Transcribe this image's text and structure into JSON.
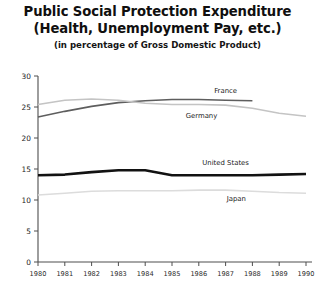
{
  "header": {
    "title_line_1": "Public Social Protection Expenditure",
    "title_line_2": "(Health, Unemployment Pay, etc.)",
    "subtitle": "(in percentage of Gross Domestic Product)"
  },
  "chart_data": {
    "type": "line",
    "title": "Public Social Protection Expenditure (Health, Unemployment Pay, etc.)",
    "subtitle": "(in percentage of Gross Domestic Product)",
    "xlabel": "",
    "ylabel": "",
    "grid": false,
    "legend_position": "inline-labels",
    "xlim": [
      1980,
      1990
    ],
    "ylim": [
      0,
      30
    ],
    "ytick_labels": [
      "0",
      "5",
      "10",
      "15",
      "20",
      "25",
      "30"
    ],
    "yticks": [
      0,
      5,
      10,
      15,
      20,
      25,
      30
    ],
    "x": [
      1980,
      1981,
      1982,
      1983,
      1984,
      1985,
      1986,
      1987,
      1988,
      1989,
      1990
    ],
    "xtick_labels": [
      "1980",
      "1981",
      "1982",
      "1983",
      "1984",
      "1985",
      "1986",
      "1987",
      "1988",
      "1989",
      "1990"
    ],
    "series": [
      {
        "name": "France",
        "color": "#5e5e5e",
        "width": 1.6,
        "label_x": 1987.0,
        "label_y": 27.2,
        "x": [
          1980,
          1981,
          1982,
          1983,
          1984,
          1985,
          1986,
          1987,
          1988
        ],
        "values": [
          23.4,
          24.3,
          25.1,
          25.7,
          26.0,
          26.2,
          26.2,
          26.1,
          26.0
        ]
      },
      {
        "name": "Germany",
        "color": "#c4c4c4",
        "width": 1.6,
        "label_x": 1986.1,
        "label_y": 23.2,
        "x": [
          1980,
          1981,
          1982,
          1983,
          1984,
          1985,
          1986,
          1987,
          1988,
          1989,
          1990
        ],
        "values": [
          25.4,
          26.1,
          26.3,
          26.1,
          25.6,
          25.4,
          25.4,
          25.3,
          24.8,
          24.0,
          23.5
        ]
      },
      {
        "name": "United States",
        "color": "#121212",
        "width": 2.6,
        "label_x": 1987.0,
        "label_y": 15.6,
        "x": [
          1980,
          1981,
          1982,
          1983,
          1984,
          1985,
          1986,
          1987,
          1988,
          1989,
          1990
        ],
        "values": [
          14.0,
          14.1,
          14.5,
          14.8,
          14.8,
          14.0,
          14.0,
          14.0,
          14.0,
          14.1,
          14.2
        ]
      },
      {
        "name": "Japan",
        "color": "#dcdcdc",
        "width": 1.6,
        "label_x": 1987.4,
        "label_y": 9.8,
        "x": [
          1980,
          1981,
          1982,
          1983,
          1984,
          1985,
          1986,
          1987,
          1988,
          1989,
          1990
        ],
        "values": [
          10.8,
          11.1,
          11.4,
          11.5,
          11.5,
          11.5,
          11.6,
          11.6,
          11.4,
          11.2,
          11.1
        ]
      }
    ]
  }
}
